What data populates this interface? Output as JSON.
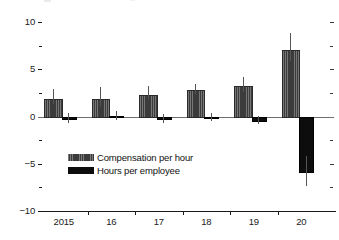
{
  "chart_data": {
    "type": "bar",
    "title": "",
    "subtitle": "",
    "xlabel": "",
    "ylabel": "",
    "categories": [
      "2015",
      "16",
      "17",
      "18",
      "19",
      "20"
    ],
    "ylim": [
      -10,
      10
    ],
    "yticks": [
      10,
      5,
      0,
      -5,
      -10
    ],
    "ytick_labels": [
      "10",
      "5",
      "0",
      "-5",
      "-10"
    ],
    "yminor_ticks": [
      7.5,
      2.5,
      -2.5,
      -7.5
    ],
    "grid": false,
    "legend_position": "inside lower-left",
    "zero_line": true,
    "right_axis_ticks": true,
    "series": [
      {
        "name": "Compensation per hour",
        "color": "#3b3b3b",
        "pattern": "hatched",
        "values": [
          1.8,
          1.8,
          2.3,
          2.8,
          3.2,
          7.0
        ],
        "err_low": [
          1.3,
          1.1,
          1.8,
          2.4,
          2.6,
          5.9
        ],
        "err_high": [
          2.9,
          3.1,
          3.2,
          3.4,
          4.2,
          8.8
        ]
      },
      {
        "name": "Hours per employee",
        "color": "#0d0d0d",
        "pattern": "solid",
        "values": [
          -0.15,
          0.1,
          -0.2,
          -0.05,
          -0.35,
          -5.8
        ],
        "err_low": [
          -0.7,
          -0.4,
          -0.7,
          -0.5,
          -0.8,
          -7.4
        ],
        "err_high": [
          0.4,
          0.55,
          0.25,
          0.4,
          0.1,
          -4.2
        ]
      }
    ]
  },
  "legend": {
    "items": [
      {
        "label": "Compensation per hour",
        "swatch": "comp"
      },
      {
        "label": "Hours per employee",
        "swatch": "hours"
      }
    ]
  }
}
